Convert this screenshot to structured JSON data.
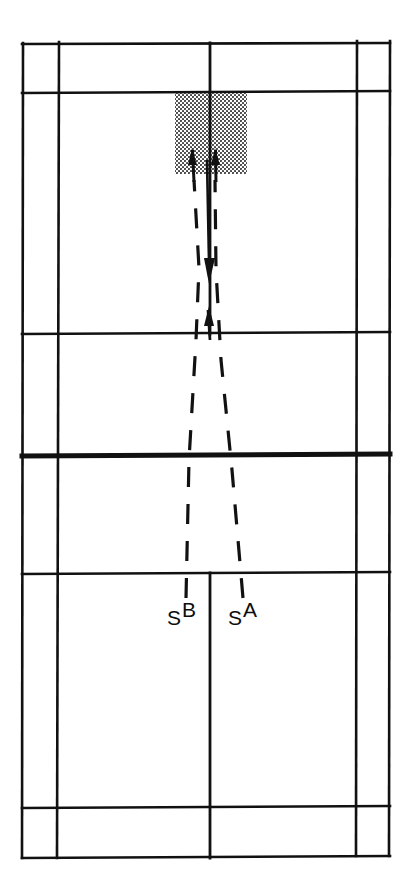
{
  "figure": {
    "type": "badminton-court-diagram",
    "title": "",
    "background_color": "#ffffff",
    "line_color": "#111111",
    "shading_color": "#3a3a3a"
  },
  "labels": [
    {
      "id": "server-b",
      "base": "S",
      "superscript": "B",
      "x": 167,
      "y": 607
    },
    {
      "id": "server-a",
      "base": "S",
      "superscript": "A",
      "x": 228,
      "y": 607
    }
  ],
  "court": {
    "name": "badminton-court",
    "outer_bounds": {
      "left": 22,
      "top": 43,
      "right": 390,
      "bottom": 857
    },
    "vertical_lines": [
      {
        "name": "left-doubles-sideline",
        "x": 23
      },
      {
        "name": "left-singles-sideline",
        "x": 58
      },
      {
        "name": "centre-line",
        "x": 210
      },
      {
        "name": "right-singles-sideline",
        "x": 357
      },
      {
        "name": "right-doubles-sideline",
        "x": 390
      }
    ],
    "horizontal_lines": [
      {
        "name": "top-back-boundary-doubles",
        "y": 44,
        "weight": "normal"
      },
      {
        "name": "top-long-service-line-doubles",
        "y": 92,
        "weight": "normal"
      },
      {
        "name": "top-short-service-line",
        "y": 333,
        "weight": "normal"
      },
      {
        "name": "net-line",
        "y": 456,
        "weight": "thick"
      },
      {
        "name": "bottom-short-service-line",
        "y": 573,
        "weight": "normal"
      },
      {
        "name": "bottom-long-service-line-doubles",
        "y": 807,
        "weight": "normal"
      },
      {
        "name": "bottom-back-boundary-doubles",
        "y": 857,
        "weight": "normal"
      }
    ]
  },
  "target_zone": {
    "name": "shaded-target-area",
    "pattern": "stipple-dots",
    "left": 175,
    "top": 92,
    "width": 72,
    "height": 82
  },
  "trajectories": [
    {
      "name": "trajectory-from-sb",
      "style": "dashed",
      "from_label": "S",
      "from_superscript": "B",
      "start": {
        "x": 186,
        "y": 598
      },
      "end": {
        "x": 193,
        "y": 160
      },
      "arrowheads": [
        "up-at-target",
        "down-mid-court"
      ]
    },
    {
      "name": "trajectory-from-sa",
      "style": "dashed",
      "from_label": "S",
      "from_superscript": "A",
      "start": {
        "x": 242,
        "y": 598
      },
      "end": {
        "x": 216,
        "y": 160
      },
      "arrowheads": [
        "up-at-target",
        "down-mid-court"
      ]
    }
  ],
  "arrow_markers": [
    {
      "name": "arrow-up-left-in-zone",
      "x": 193,
      "y": 152,
      "direction": "up"
    },
    {
      "name": "arrow-up-right-in-zone",
      "x": 216,
      "y": 152,
      "direction": "up"
    },
    {
      "name": "arrow-down-mid",
      "x": 209,
      "y": 268,
      "direction": "down"
    },
    {
      "name": "arrow-up-at-service-line",
      "x": 210,
      "y": 322,
      "direction": "up"
    }
  ]
}
